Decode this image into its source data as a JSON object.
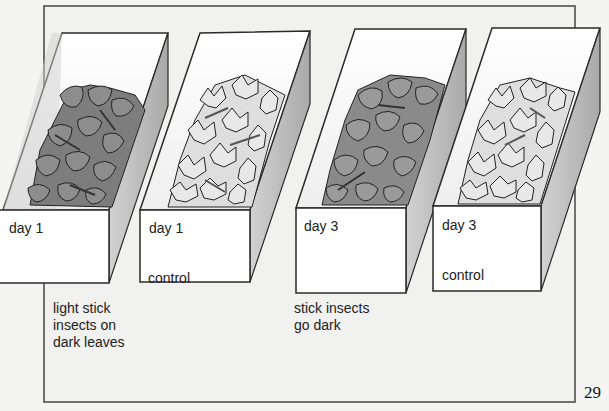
{
  "figure": {
    "boxes": [
      {
        "id": "box-1",
        "day_label": "day 1",
        "sub_label": "",
        "leaves": "dark",
        "caption": [
          "light stick",
          "insects on",
          "dark leaves"
        ]
      },
      {
        "id": "box-2",
        "day_label": "day 1",
        "sub_label": "control",
        "leaves": "light",
        "caption": []
      },
      {
        "id": "box-3",
        "day_label": "day 3",
        "sub_label": "",
        "leaves": "dark",
        "caption": [
          "stick insects",
          "go dark"
        ]
      },
      {
        "id": "box-4",
        "day_label": "day 3",
        "sub_label": "control",
        "leaves": "light",
        "caption": []
      }
    ],
    "page_number": "29",
    "colors": {
      "background": "#f4f4f2",
      "frame": "#444444",
      "box_side": "#b9b9b9",
      "box_front": "#ffffff",
      "dark_leaf": "#8a8a8a",
      "light_leaf": "#e2e2e2",
      "outline": "#2a2a2a"
    }
  }
}
